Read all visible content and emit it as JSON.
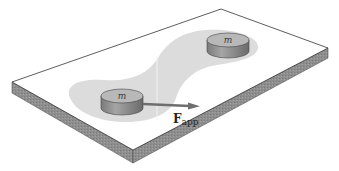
{
  "figure": {
    "masses": [
      {
        "id": "mass-left",
        "label": "m"
      },
      {
        "id": "mass-right",
        "label": "m"
      }
    ],
    "force": {
      "symbol": "F",
      "subscript": "app"
    },
    "colors": {
      "plate_top": "#ffffff",
      "plate_edge": "#8c8c8c",
      "shaded_region": "#dcdcdc",
      "cylinder_side": "#8a8a8a",
      "cylinder_top": "#b8b8b8",
      "arrow": "#6e6e6e"
    }
  }
}
